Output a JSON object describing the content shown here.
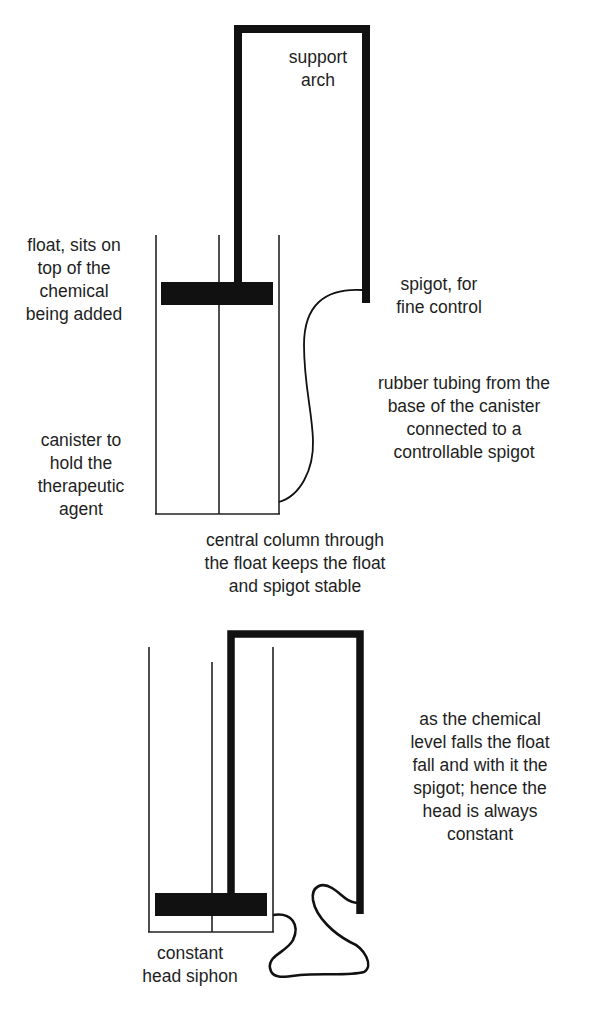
{
  "figure": {
    "top_diagram": {
      "labels": {
        "support_arch": "support\narch",
        "float": "float, sits on\ntop of the\nchemical\nbeing added",
        "spigot": "spigot, for\nfine control",
        "rubber_tubing": "rubber tubing from the\nbase of the canister\nconnected to a\ncontrollable spigot",
        "canister": "canister to\nhold the\ntherapeutic\nagent",
        "central_column": "central column through\nthe float keeps the float\nand spigot stable"
      }
    },
    "bottom_diagram": {
      "labels": {
        "explanation": "as the chemical\nlevel falls the float\nfall and with it the\nspigot; hence the\nhead is always\nconstant",
        "title": "constant\nhead siphon"
      }
    },
    "colors": {
      "line": "#111111",
      "background": "#ffffff"
    }
  }
}
